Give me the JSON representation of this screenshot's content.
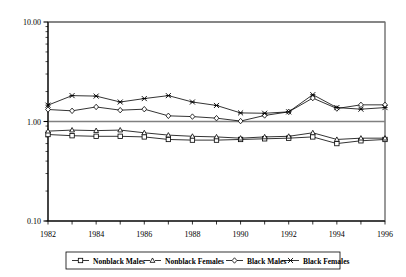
{
  "chart_data": {
    "type": "line",
    "title": "",
    "subtitle": "",
    "xlabel": "",
    "ylabel": "",
    "yscale": "log",
    "ylim": [
      0.1,
      10.0
    ],
    "xlim": [
      1982,
      1996
    ],
    "grid": false,
    "legend_position": "bottom",
    "ytick_labels": [
      "10.00",
      "1.00",
      "0.10"
    ],
    "ytick_values": [
      10.0,
      1.0,
      0.1
    ],
    "xtick_labels": [
      "1982",
      "1984",
      "1986",
      "1988",
      "1990",
      "1992",
      "1994",
      "1996"
    ],
    "xtick_values": [
      1982,
      1984,
      1986,
      1988,
      1990,
      1992,
      1994,
      1996
    ],
    "x": [
      1982,
      1983,
      1984,
      1985,
      1986,
      1987,
      1988,
      1989,
      1990,
      1991,
      1992,
      1993,
      1994,
      1995,
      1996
    ],
    "series": [
      {
        "name": "Nonblack Males",
        "marker": "square",
        "values": [
          0.74,
          0.72,
          0.71,
          0.71,
          0.7,
          0.66,
          0.65,
          0.65,
          0.66,
          0.67,
          0.68,
          0.7,
          0.6,
          0.64,
          0.66
        ]
      },
      {
        "name": "Nonblack Females",
        "marker": "triangle",
        "values": [
          0.8,
          0.82,
          0.81,
          0.82,
          0.77,
          0.73,
          0.71,
          0.7,
          0.68,
          0.7,
          0.71,
          0.77,
          0.66,
          0.68,
          0.68
        ]
      },
      {
        "name": "Black Males",
        "marker": "diamond",
        "values": [
          1.32,
          1.28,
          1.4,
          1.3,
          1.33,
          1.14,
          1.12,
          1.08,
          1.01,
          1.15,
          1.25,
          1.72,
          1.35,
          1.47,
          1.47
        ]
      },
      {
        "name": "Black Females",
        "marker": "cross",
        "values": [
          1.46,
          1.82,
          1.8,
          1.57,
          1.7,
          1.82,
          1.57,
          1.45,
          1.22,
          1.21,
          1.25,
          1.86,
          1.38,
          1.33,
          1.38
        ]
      }
    ]
  },
  "legend": {
    "items": [
      {
        "label": "Nonblack Males",
        "marker": "square"
      },
      {
        "label": "Nonblack Females",
        "marker": "triangle"
      },
      {
        "label": "Black Males",
        "marker": "diamond"
      },
      {
        "label": "Black Females",
        "marker": "cross"
      }
    ]
  },
  "colors": {
    "line": "#000000",
    "axis": "#000000",
    "gridline": "#808080",
    "background": "#ffffff"
  }
}
